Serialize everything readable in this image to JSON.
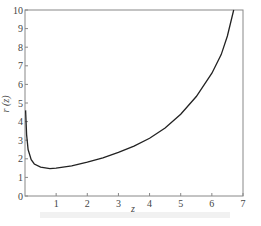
{
  "chart_data": {
    "type": "line",
    "title": "",
    "xlabel": "z",
    "ylabel": "r (z)",
    "xlim": [
      0,
      7
    ],
    "ylim": [
      0,
      10
    ],
    "grid": false,
    "x_ticks": [
      "1",
      "2",
      "3",
      "4",
      "5",
      "6",
      "7"
    ],
    "y_ticks": [
      "0",
      "1",
      "2",
      "3",
      "4",
      "5",
      "6",
      "7",
      "8",
      "9",
      "10"
    ],
    "series": [
      {
        "name": "r(z)",
        "x": [
          0.02,
          0.05,
          0.1,
          0.2,
          0.3,
          0.5,
          0.8,
          1.0,
          1.5,
          2.0,
          2.5,
          3.0,
          3.5,
          4.0,
          4.5,
          5.0,
          5.5,
          6.0,
          6.3,
          6.5,
          6.7
        ],
        "values": [
          4.6,
          3.3,
          2.5,
          1.95,
          1.72,
          1.55,
          1.47,
          1.5,
          1.62,
          1.82,
          2.05,
          2.35,
          2.68,
          3.1,
          3.65,
          4.4,
          5.35,
          6.6,
          7.6,
          8.6,
          10.0
        ]
      }
    ]
  }
}
